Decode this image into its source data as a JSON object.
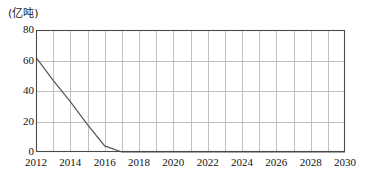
{
  "chart_data": {
    "type": "line",
    "title": "",
    "subtitle": "",
    "unit_label": "(亿吨)",
    "xlabel": "",
    "ylabel": "",
    "xlim": [
      2012,
      2030
    ],
    "ylim": [
      0,
      80
    ],
    "grid": true,
    "legend": "none",
    "y_ticks": [
      80,
      60,
      40,
      20,
      0
    ],
    "y_tick_labels": [
      "80",
      "60",
      "40",
      "20",
      "0"
    ],
    "x_ticks": [
      2012,
      2014,
      2016,
      2018,
      2020,
      2022,
      2024,
      2026,
      2028,
      2030
    ],
    "x_tick_labels": [
      "2012",
      "2014",
      "2016",
      "2018",
      "2020",
      "2022",
      "2024",
      "2026",
      "2028",
      "2030"
    ],
    "x_gridline_years": [
      2012,
      2013,
      2014,
      2015,
      2016,
      2017,
      2018,
      2019,
      2020,
      2021,
      2022,
      2023,
      2024,
      2025,
      2026,
      2027,
      2028,
      2029,
      2030
    ],
    "y_gridline_values": [
      20,
      40,
      60
    ],
    "series": [
      {
        "name": "series-1",
        "color": "#555555",
        "x": [
          2012,
          2013,
          2014,
          2015,
          2016,
          2017,
          2018,
          2019,
          2020,
          2021,
          2022,
          2023,
          2024,
          2025,
          2026,
          2027,
          2028,
          2029,
          2030
        ],
        "values": [
          62,
          47,
          33,
          18,
          4,
          0,
          0,
          0,
          0,
          0,
          0,
          0,
          0,
          0,
          0,
          0,
          0,
          0,
          0
        ]
      }
    ]
  },
  "style": {
    "frame_color": "#4a4a4a",
    "grid_color": "#b9b9b9",
    "line_color": "#555555",
    "text_color": "#111111",
    "background": "#ffffff"
  }
}
